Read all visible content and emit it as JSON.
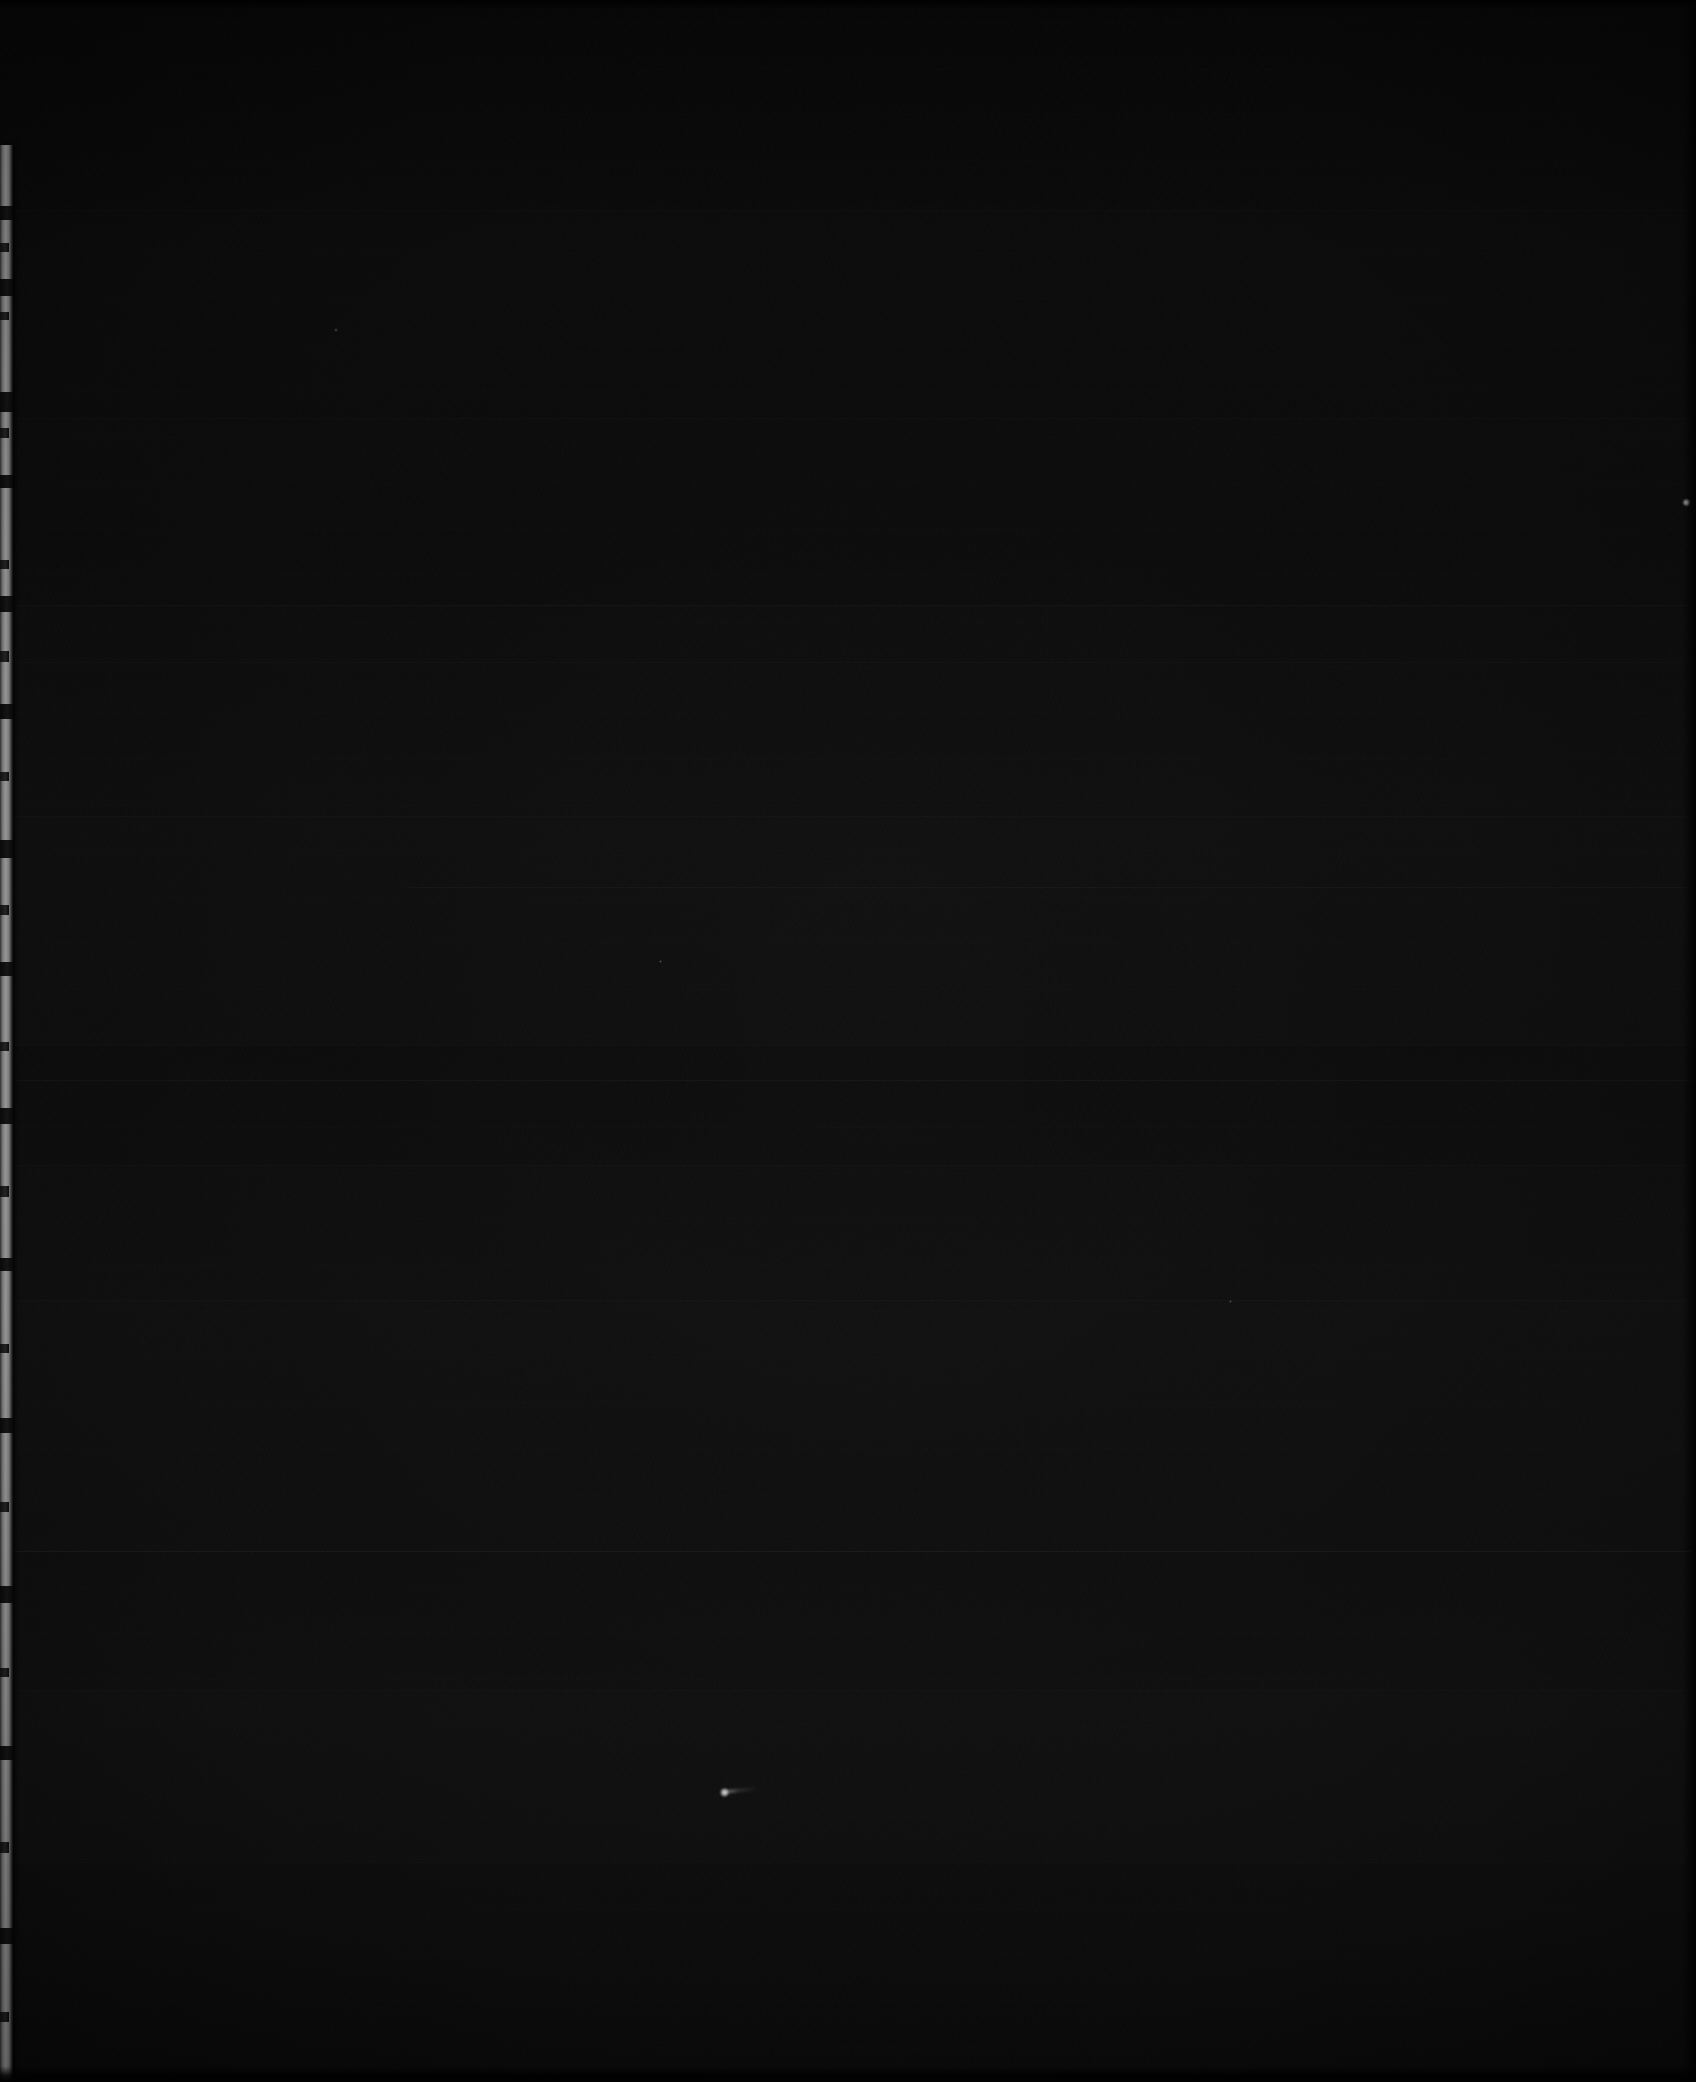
{
  "image": {
    "kind": "dark-scan",
    "width": 1696,
    "height": 2082,
    "description": "Near-black underexposed page scan with faint horizontal banding and a lit page edge along the left side",
    "alt_text": "Almost entirely black image; a narrow light-gray vertical strip runs along the left edge"
  },
  "colors": {
    "field_black": "#080808",
    "field_black_light": "#0c0c0c",
    "field_black_dark": "#050505",
    "edge_strip_highlight": "#b9b9b9",
    "edge_strip_mid": "#8e8e8e",
    "edge_strip_shadow": "#3a3a3a",
    "speck_white": "#ffffff",
    "frame_background": "#000000"
  },
  "page_edge": {
    "label": "page-edge-highlight",
    "x": 0,
    "width": 13,
    "top": 145,
    "bottom": 2082,
    "notches": [
      {
        "top": 206,
        "height": 14,
        "style": "deep"
      },
      {
        "top": 243,
        "height": 9,
        "style": "shallow"
      },
      {
        "top": 279,
        "height": 17,
        "style": "deep"
      },
      {
        "top": 312,
        "height": 8,
        "style": "shallow"
      },
      {
        "top": 392,
        "height": 20,
        "style": "deep"
      },
      {
        "top": 428,
        "height": 10,
        "style": "shallow"
      },
      {
        "top": 475,
        "height": 13,
        "style": "deep"
      },
      {
        "top": 560,
        "height": 9,
        "style": "shallow"
      },
      {
        "top": 596,
        "height": 16,
        "style": "deep"
      },
      {
        "top": 651,
        "height": 11,
        "style": "shallow"
      },
      {
        "top": 704,
        "height": 15,
        "style": "deep"
      },
      {
        "top": 772,
        "height": 9,
        "style": "shallow"
      },
      {
        "top": 840,
        "height": 18,
        "style": "deep"
      },
      {
        "top": 905,
        "height": 10,
        "style": "shallow"
      },
      {
        "top": 962,
        "height": 14,
        "style": "deep"
      },
      {
        "top": 1042,
        "height": 9,
        "style": "shallow"
      },
      {
        "top": 1108,
        "height": 16,
        "style": "deep"
      },
      {
        "top": 1186,
        "height": 11,
        "style": "shallow"
      },
      {
        "top": 1258,
        "height": 13,
        "style": "deep"
      },
      {
        "top": 1344,
        "height": 9,
        "style": "shallow"
      },
      {
        "top": 1418,
        "height": 15,
        "style": "deep"
      },
      {
        "top": 1502,
        "height": 10,
        "style": "shallow"
      },
      {
        "top": 1586,
        "height": 17,
        "style": "deep"
      },
      {
        "top": 1668,
        "height": 9,
        "style": "shallow"
      },
      {
        "top": 1746,
        "height": 14,
        "style": "deep"
      },
      {
        "top": 1842,
        "height": 11,
        "style": "shallow"
      },
      {
        "top": 1928,
        "height": 16,
        "style": "deep"
      },
      {
        "top": 2012,
        "height": 10,
        "style": "shallow"
      }
    ]
  },
  "band_lines": [
    {
      "top": 210,
      "weight": "softer",
      "span": "full"
    },
    {
      "top": 418,
      "weight": "softer",
      "span": "full"
    },
    {
      "top": 605,
      "weight": "soft",
      "span": "full"
    },
    {
      "top": 662,
      "weight": "softer",
      "span": "full"
    },
    {
      "top": 816,
      "weight": "softer",
      "span": "full"
    },
    {
      "top": 887,
      "weight": "soft",
      "span": "partial"
    },
    {
      "top": 1045,
      "weight": "softer",
      "span": "full"
    },
    {
      "top": 1080,
      "weight": "soft",
      "span": "full"
    },
    {
      "top": 1165,
      "weight": "softer",
      "span": "full"
    },
    {
      "top": 1300,
      "weight": "softer",
      "span": "full"
    },
    {
      "top": 1551,
      "weight": "normal",
      "span": "full"
    },
    {
      "top": 1690,
      "weight": "softer",
      "span": "full"
    },
    {
      "top": 1862,
      "weight": "softer",
      "span": "full"
    }
  ],
  "band_blocks": [
    {
      "top": 0,
      "height": 205,
      "alpha": 0.0
    },
    {
      "top": 210,
      "height": 208,
      "alpha": 0.006
    },
    {
      "top": 418,
      "height": 187,
      "alpha": 0.01
    },
    {
      "top": 605,
      "height": 211,
      "alpha": 0.014
    },
    {
      "top": 816,
      "height": 229,
      "alpha": 0.018
    },
    {
      "top": 1045,
      "height": 120,
      "alpha": 0.012
    },
    {
      "top": 1165,
      "height": 135,
      "alpha": 0.016
    },
    {
      "top": 1300,
      "height": 251,
      "alpha": 0.02
    },
    {
      "top": 1551,
      "height": 139,
      "alpha": 0.014
    },
    {
      "top": 1690,
      "height": 172,
      "alpha": 0.018
    },
    {
      "top": 1862,
      "height": 220,
      "alpha": 0.01
    }
  ],
  "specks": [
    {
      "name": "speck-primary",
      "x": 724,
      "y": 1792,
      "size": 11,
      "tail_width": 34,
      "tail_angle": -6
    },
    {
      "name": "speck-secondary",
      "x": 1686,
      "y": 502,
      "size": 9,
      "tail_width": 0,
      "tail_angle": 0
    },
    {
      "name": "speck-tertiary",
      "x": 336,
      "y": 330,
      "size": 4,
      "tail_width": 0,
      "tail_angle": 0
    },
    {
      "name": "speck-quaternary",
      "x": 660,
      "y": 961,
      "size": 3,
      "tail_width": 0,
      "tail_angle": 0
    },
    {
      "name": "speck-fifth",
      "x": 1230,
      "y": 1301,
      "size": 3,
      "tail_width": 0,
      "tail_angle": 0
    }
  ]
}
